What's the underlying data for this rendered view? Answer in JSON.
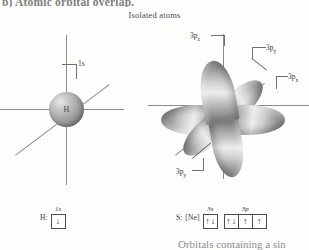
{
  "page": {
    "heading_partial": "b) Atomic orbital overlap.",
    "section_title": "Isolated atoms",
    "caption_partial": "Orbitals containing a sin"
  },
  "hydrogen_diagram": {
    "nucleus_label": "H",
    "orbital_label": "1s"
  },
  "sulfur_diagram": {
    "labels": {
      "top": "3pz",
      "upper_right": "3py",
      "right": "3px",
      "lower_left": "3py"
    },
    "label_top_base": "3p",
    "label_top_sub": "z",
    "label_upper_right_base": "3p",
    "label_upper_right_sub": "y",
    "label_right_base": "3p",
    "label_right_sub": "x",
    "label_lower_left_base": "3p",
    "label_lower_left_sub": "y"
  },
  "hydrogen_config": {
    "symbol": "H:",
    "subshells": [
      {
        "label": "1s",
        "boxes": [
          {
            "arrows": [
              "up"
            ]
          }
        ]
      }
    ]
  },
  "sulfur_config": {
    "symbol": "S:",
    "core": "[Ne]",
    "subshells": [
      {
        "label": "3s",
        "boxes": [
          {
            "arrows": [
              "up",
              "down"
            ]
          }
        ]
      },
      {
        "label": "3p",
        "boxes": [
          {
            "arrows": [
              "up",
              "down"
            ]
          },
          {
            "arrows": [
              "up"
            ]
          },
          {
            "arrows": [
              "up"
            ]
          }
        ]
      }
    ]
  },
  "colors": {
    "background": "#fdfdfc",
    "axis": "#8a8a8a",
    "text": "#3a3a3a",
    "faded_text": "#8d8d8d",
    "lobe_dark": "#6b6b6b",
    "lobe_light": "#ededed"
  }
}
